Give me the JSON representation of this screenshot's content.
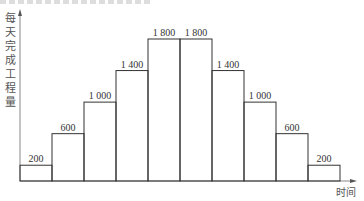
{
  "chart_data": {
    "type": "bar",
    "title": "",
    "xlabel": "时间",
    "ylabel": "每天完成工程量",
    "categories": [
      "1",
      "2",
      "3",
      "4",
      "5",
      "6",
      "7",
      "8",
      "9",
      "10"
    ],
    "values": [
      200,
      600,
      1000,
      1400,
      1800,
      1800,
      1400,
      1000,
      600,
      200
    ],
    "value_labels": [
      "200",
      "600",
      "1 000",
      "1 400",
      "1 800",
      "1 800",
      "1 400",
      "1 000",
      "600",
      "200"
    ],
    "ylim": [
      0,
      2000
    ],
    "grid": false,
    "legend": null,
    "bar_style": "outlined, no gap (histogram-like)"
  },
  "axes": {
    "x_label": "时间",
    "y_label_chars": [
      "每",
      "天",
      "完",
      "成",
      "工",
      "程",
      "量"
    ]
  },
  "colors": {
    "stroke": "#333333",
    "axis": "#888888",
    "background": "#ffffff"
  }
}
